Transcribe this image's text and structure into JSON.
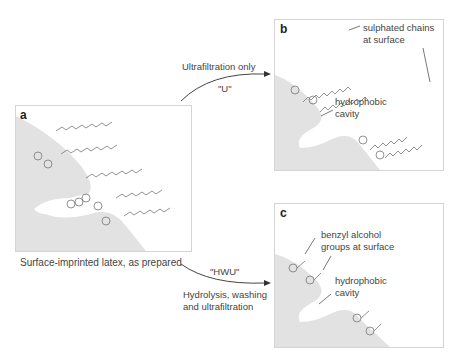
{
  "panels": {
    "a": {
      "label": "a",
      "caption": "Surface-imprinted latex, as prepared"
    },
    "b": {
      "label": "b",
      "annotations": {
        "sulphated_line1": "sulphated chains",
        "sulphated_line2": "at surface",
        "cavity_line1": "hydrophobic",
        "cavity_line2": "cavity"
      }
    },
    "c": {
      "label": "c",
      "annotations": {
        "benzyl_line1": "benzyl alcohol",
        "benzyl_line2": "groups at surface",
        "cavity_line1": "hydrophobic",
        "cavity_line2": "cavity"
      }
    }
  },
  "arrows": {
    "upper": {
      "label": "Ultrafiltration only",
      "code": "\"U\""
    },
    "lower": {
      "code": "\"HWU\"",
      "label_line1": "Hydrolysis, washing",
      "label_line2": "and ultrafiltration"
    }
  },
  "colors": {
    "surface": "#e2e2e2",
    "border": "#d4d4d4",
    "line": "#555555"
  }
}
